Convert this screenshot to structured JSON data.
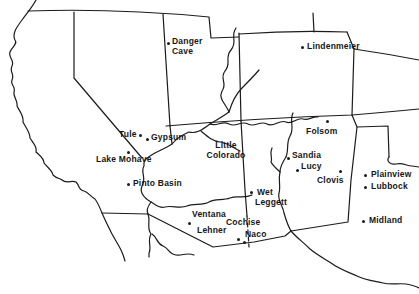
{
  "figure": {
    "type": "map",
    "region_shown": "Southwestern United States with Mexico border",
    "colors": {
      "background": "#ffffff",
      "ink": "#1b1b1b"
    }
  },
  "sites": [
    {
      "id": "danger-cave",
      "lines": [
        "Danger",
        "Cave"
      ],
      "has_dot": true
    },
    {
      "id": "lindenmeier",
      "lines": [
        "Lindenmeier"
      ],
      "has_dot": true
    },
    {
      "id": "tule",
      "lines": [
        "Tule"
      ],
      "has_dot": true
    },
    {
      "id": "gypsum",
      "lines": [
        "Gypsum"
      ],
      "has_dot": true
    },
    {
      "id": "lake-mohave",
      "lines": [
        "Lake Mohave"
      ],
      "has_dot": true
    },
    {
      "id": "pinto-basin",
      "lines": [
        "Pinto Basin"
      ],
      "has_dot": true
    },
    {
      "id": "little-colorado",
      "lines": [
        "Little",
        "Colorado"
      ],
      "has_dot": false
    },
    {
      "id": "folsom",
      "lines": [
        "Folsom"
      ],
      "has_dot": true
    },
    {
      "id": "sandia",
      "lines": [
        "Sandia"
      ],
      "has_dot": true
    },
    {
      "id": "lucy",
      "lines": [
        "Lucy"
      ],
      "has_dot": true
    },
    {
      "id": "clovis",
      "lines": [
        "Clovis"
      ],
      "has_dot": true
    },
    {
      "id": "plainview",
      "lines": [
        "Plainview"
      ],
      "has_dot": true
    },
    {
      "id": "lubbock",
      "lines": [
        "Lubbock"
      ],
      "has_dot": true
    },
    {
      "id": "wet-leggett",
      "lines": [
        "Wet",
        "Leggett"
      ],
      "has_dot": true
    },
    {
      "id": "ventana",
      "lines": [
        "Ventana"
      ],
      "has_dot": true
    },
    {
      "id": "cochise",
      "lines": [
        "Cochise"
      ],
      "has_dot": false
    },
    {
      "id": "lehner",
      "lines": [
        "Lehner"
      ],
      "has_dot": true
    },
    {
      "id": "naco",
      "lines": [
        "Naco"
      ],
      "has_dot": true
    },
    {
      "id": "midland",
      "lines": [
        "Midland"
      ],
      "has_dot": true
    }
  ]
}
